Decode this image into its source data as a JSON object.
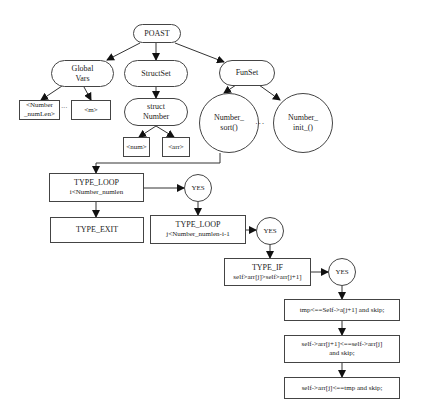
{
  "diagram": {
    "root": "POAST",
    "level1": {
      "global_vars": [
        "Global",
        "Vars"
      ],
      "struct_set": "StructSet",
      "fun_set": "FunSet"
    },
    "global_vars_children": {
      "number_numlen": [
        "<Number",
        "_numLen>"
      ],
      "ellipsis": "· · ·",
      "m": "<m>"
    },
    "struct_number": [
      "struct",
      "Number"
    ],
    "struct_fields": {
      "num": "<num>",
      "arr": "<arr>"
    },
    "functions": {
      "sort": [
        "Number_",
        "sort()"
      ],
      "ellipsis": "· · ·",
      "init": [
        "Number_",
        "init_()"
      ]
    },
    "flow": {
      "loop_i": [
        "TYPE_LOOP",
        "i<Number_numlen"
      ],
      "yes1": "YES",
      "exit": "TYPE_EXIT",
      "loop_j": [
        "TYPE_LOOP",
        "j<Number_numlen-i-1"
      ],
      "yes2": "YES",
      "if": [
        "TYPE_IF",
        "self>arr[j]>self>arr[j+1]"
      ],
      "yes3": "YES",
      "stmt1": "tmp<==Self->a[j+1] and skip;",
      "stmt2": [
        "self->arr[j+1]<==self->arr[j]",
        "and skip;"
      ],
      "stmt3": "self->arr[j]<==tmp and skip;"
    }
  }
}
